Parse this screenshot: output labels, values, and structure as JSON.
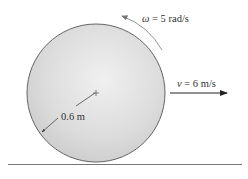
{
  "diagram": {
    "disk": {
      "radius_label": "0.6 m"
    },
    "angular_velocity": {
      "symbol": "ω",
      "equals": " = 5 rad/s"
    },
    "linear_velocity": {
      "symbol": "v",
      "equals": " = 6 m/s"
    },
    "colors": {
      "disk_fill": "#d9d9d9",
      "outline": "#555555",
      "ground": "#777777"
    }
  }
}
